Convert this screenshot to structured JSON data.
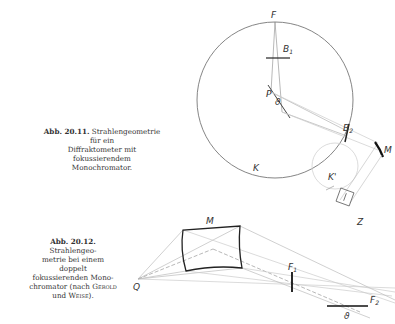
{
  "figure_1": {
    "caption_number": "Abb. 20.11.",
    "caption_line1": "Strahlengeometrie für ein",
    "caption_line2": "Diffraktometer mit fokussierendem",
    "caption_line3": "Monochromator.",
    "labels": {
      "F": "F",
      "B1": "B",
      "B1_sub": "1",
      "P": "P",
      "theta": "ϑ",
      "B2": "B",
      "B2_sub": "2",
      "M": "M",
      "K_circle": "K",
      "K_prime": "K'",
      "Z": "Z"
    }
  },
  "figure_2": {
    "caption_number": "Abb. 20.12.",
    "caption_line1": "Strahlengeo-",
    "caption_line2": "metrie bei einem doppelt",
    "caption_line3": "fokussierenden Mono-",
    "caption_line4": "chromator (nach",
    "caption_author1": "Gerold",
    "caption_line5": "und",
    "caption_author2": "Weise",
    "caption_end": ").",
    "labels": {
      "M": "M",
      "Q": "Q",
      "F1": "F",
      "F1_sub": "1",
      "F2": "F",
      "F2_sub": "2",
      "theta": "ϑ"
    }
  }
}
